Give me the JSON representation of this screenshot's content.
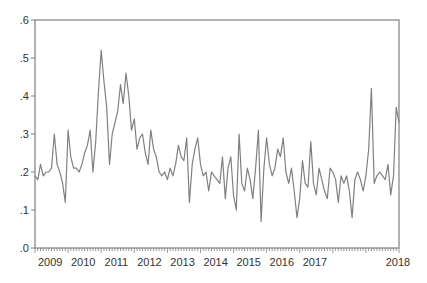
{
  "chart_data": {
    "type": "line",
    "title": "",
    "xlabel": "",
    "ylabel": "",
    "ylim": [
      0.0,
      0.6
    ],
    "yticks": [
      ".0",
      ".1",
      ".2",
      ".3",
      ".4",
      ".5",
      ".6"
    ],
    "ytick_values": [
      0.0,
      0.1,
      0.2,
      0.3,
      0.4,
      0.5,
      0.6
    ],
    "xticks": [
      "2009",
      "2010",
      "2011",
      "2012",
      "2013",
      "2014",
      "2015",
      "2016",
      "2017",
      "2018"
    ],
    "grid": false,
    "legend": null,
    "frequency": "monthly",
    "start": "2009M01",
    "line_color": "#808080",
    "series": [
      {
        "name": "series",
        "values": [
          0.19,
          0.18,
          0.22,
          0.19,
          0.2,
          0.2,
          0.21,
          0.3,
          0.22,
          0.2,
          0.17,
          0.12,
          0.31,
          0.24,
          0.21,
          0.21,
          0.2,
          0.22,
          0.25,
          0.27,
          0.31,
          0.2,
          0.28,
          0.41,
          0.52,
          0.44,
          0.37,
          0.22,
          0.3,
          0.33,
          0.36,
          0.43,
          0.38,
          0.46,
          0.4,
          0.31,
          0.34,
          0.26,
          0.29,
          0.3,
          0.25,
          0.22,
          0.31,
          0.26,
          0.24,
          0.2,
          0.19,
          0.2,
          0.18,
          0.21,
          0.19,
          0.22,
          0.27,
          0.24,
          0.23,
          0.29,
          0.12,
          0.22,
          0.26,
          0.29,
          0.22,
          0.19,
          0.2,
          0.15,
          0.2,
          0.19,
          0.18,
          0.17,
          0.24,
          0.13,
          0.21,
          0.24,
          0.14,
          0.1,
          0.3,
          0.17,
          0.15,
          0.21,
          0.18,
          0.13,
          0.21,
          0.31,
          0.07,
          0.21,
          0.29,
          0.22,
          0.19,
          0.21,
          0.26,
          0.24,
          0.29,
          0.2,
          0.17,
          0.21,
          0.15,
          0.08,
          0.13,
          0.23,
          0.17,
          0.16,
          0.28,
          0.17,
          0.14,
          0.21,
          0.18,
          0.15,
          0.13,
          0.21,
          0.2,
          0.18,
          0.12,
          0.19,
          0.17,
          0.19,
          0.15,
          0.08,
          0.18,
          0.2,
          0.18,
          0.15,
          0.19,
          0.26,
          0.42,
          0.17,
          0.19,
          0.2,
          0.19,
          0.18,
          0.22,
          0.14,
          0.19,
          0.37,
          0.33
        ]
      }
    ]
  }
}
